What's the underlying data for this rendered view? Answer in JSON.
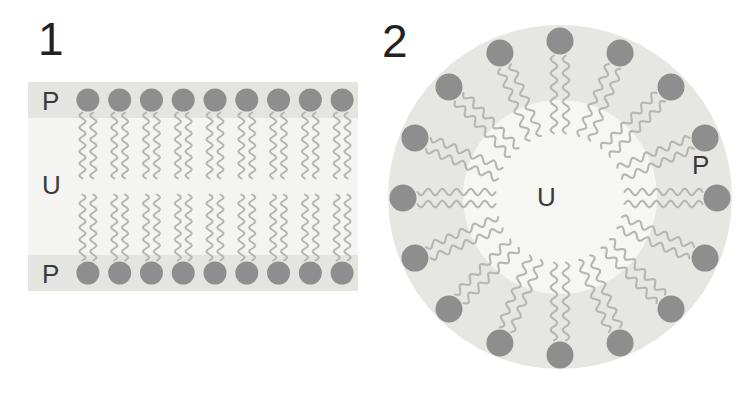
{
  "figure": {
    "width": 745,
    "height": 393,
    "background_color": "#ffffff",
    "caption_free": true
  },
  "palette": {
    "head_group_color": "#8e8e8e",
    "tail_color": "#b6b6b6",
    "polar_band_color": "#e4e4e0",
    "nonpolar_region_color": "#f4f4f2",
    "micelle_disc_color": "#e6e6e2",
    "micelle_core_color": "#f6f6f4",
    "label_color": "#3a3a3a",
    "number_color": "#222222"
  },
  "panels": [
    {
      "id": "panel-1",
      "number": "1",
      "structure_name": "lipid-bilayer",
      "labels": [
        {
          "id": "p-top",
          "text": "P",
          "meaning": "polar region",
          "x": 42,
          "y": 88
        },
        {
          "id": "u-left",
          "text": "U",
          "meaning": "nonpolar region",
          "x": 42,
          "y": 172
        },
        {
          "id": "p-bottom",
          "text": "P",
          "meaning": "polar region",
          "x": 42,
          "y": 261
        }
      ],
      "lipid_count_per_leaflet": 9,
      "leaflet_count": 2,
      "tails_per_lipid": 2
    },
    {
      "id": "panel-2",
      "number": "2",
      "structure_name": "micelle",
      "labels": [
        {
          "id": "u-center",
          "text": "U",
          "meaning": "nonpolar region",
          "x": 537,
          "y": 184
        },
        {
          "id": "p-right",
          "text": "P",
          "meaning": "polar region",
          "x": 692,
          "y": 152
        }
      ],
      "lipid_count": 16,
      "tails_per_lipid": 2,
      "circle": {
        "center_x": 560,
        "center_y": 197,
        "radius": 172
      }
    }
  ],
  "chart_data": {
    "type": "diagram",
    "title": "",
    "subtitle": "",
    "items": [
      {
        "label": "1",
        "name": "Planar lipid bilayer",
        "regions": [
          "P",
          "U",
          "P"
        ],
        "region_meanings": [
          "polar",
          "nonpolar",
          "polar"
        ],
        "lipids": 18
      },
      {
        "label": "2",
        "name": "Spherical micelle cross section",
        "regions": [
          "P",
          "U"
        ],
        "region_meanings": [
          "polar (outer shell)",
          "nonpolar (core)"
        ],
        "lipids": 16
      }
    ],
    "legend": [
      {
        "key": "P",
        "value": "polar"
      },
      {
        "key": "U",
        "value": "nonpolar"
      }
    ]
  }
}
